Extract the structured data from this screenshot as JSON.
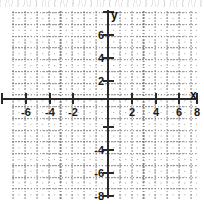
{
  "figure": {
    "kind": "cartesian-coordinate-grid",
    "background_color": "#ffffff",
    "axis_color": "#2a2a2a",
    "grid_color": "#9a9a9a",
    "label_color": "#1a1a1a"
  },
  "axes": {
    "x_name": "x",
    "y_name": "y"
  },
  "chart_data": {
    "type": "scatter",
    "title": "",
    "subtitle": "",
    "xlabel": "x",
    "ylabel": "y",
    "xlim": [
      -8,
      8
    ],
    "ylim": [
      -8,
      8
    ],
    "grid": true,
    "grid_style": "dotted",
    "minor_tick_step": 1,
    "major_tick_step": 2,
    "legend": null,
    "series": [],
    "x": [],
    "values": [],
    "annotations": [],
    "x_tick_values": [
      -8,
      -6,
      -4,
      -2,
      0,
      2,
      4,
      6,
      8
    ],
    "x_tick_labels": [
      "",
      "-6",
      "-4",
      "-2",
      "",
      "2",
      "4",
      "6",
      "8"
    ],
    "y_tick_values": [
      8,
      6,
      4,
      2,
      0,
      -2,
      -4,
      -6,
      -8
    ],
    "y_tick_labels": [
      "",
      "6",
      "4",
      "2",
      "",
      "",
      "-4",
      "-6",
      "-8"
    ]
  },
  "x_ticks": [
    {
      "value": -8,
      "label": "",
      "px": 2
    },
    {
      "value": -6,
      "label": "-6",
      "px": 26
    },
    {
      "value": -4,
      "label": "-4",
      "px": 50
    },
    {
      "value": -2,
      "label": "-2",
      "px": 73
    },
    {
      "value": 0,
      "label": "",
      "px": 108
    },
    {
      "value": 2,
      "label": "2",
      "px": 132
    },
    {
      "value": 4,
      "label": "4",
      "px": 156
    },
    {
      "value": 6,
      "label": "6",
      "px": 179
    },
    {
      "value": 8,
      "label": "8",
      "px": 197
    }
  ],
  "y_ticks": [
    {
      "value": 8,
      "label": "",
      "px": 12
    },
    {
      "value": 6,
      "label": "6",
      "px": 35
    },
    {
      "value": 4,
      "label": "4",
      "px": 58
    },
    {
      "value": 2,
      "label": "2",
      "px": 81
    },
    {
      "value": 0,
      "label": "",
      "px": 99
    },
    {
      "value": -2,
      "label": "",
      "px": 127
    },
    {
      "value": -4,
      "label": "-4",
      "px": 150
    },
    {
      "value": -6,
      "label": "-6",
      "px": 173
    },
    {
      "value": -8,
      "label": "-8",
      "px": 196
    }
  ]
}
